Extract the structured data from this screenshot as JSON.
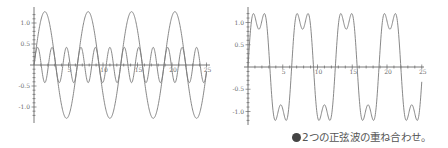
{
  "caption": {
    "text": "2つの正弦波の重ね合わせ。",
    "bullet_icon": "filled-circle"
  },
  "colors": {
    "curve": "#7a7a7a",
    "axis": "#555555",
    "label": "#6a6a6a",
    "caption_bullet": "#444444"
  },
  "chart_data": [
    {
      "type": "line",
      "title": "",
      "xlabel": "",
      "ylabel": "",
      "x_ticks": [
        5,
        10,
        15,
        20,
        25
      ],
      "x_tick_labels": [
        "5",
        "10",
        "15",
        "20",
        "25"
      ],
      "y_ticks": [
        1.0,
        0.5,
        -0.5,
        -1.0
      ],
      "y_tick_labels": [
        "1.0",
        "0.5",
        "-0.5",
        "-1.0"
      ],
      "xlim": [
        0,
        25
      ],
      "ylim": [
        -1.35,
        1.35
      ],
      "grid": false,
      "legend": false,
      "series": [
        {
          "name": "sin(x) component",
          "formula": "(4/pi)*sin(x)",
          "amplitude": 1.27,
          "frequency": 1
        },
        {
          "name": "sin(3x) component",
          "formula": "(4/(3pi))*sin(3x)",
          "amplitude": 0.42,
          "frequency": 3
        }
      ],
      "layout": {
        "origin_px": [
          34,
          65
        ],
        "px_per_x": 6.9,
        "px_per_y": 42,
        "y_axis_top": 7,
        "y_axis_bottom": 123,
        "x_axis_right": 210
      }
    },
    {
      "type": "line",
      "title": "",
      "xlabel": "",
      "ylabel": "",
      "x_ticks": [
        5,
        10,
        15,
        20,
        25
      ],
      "x_tick_labels": [
        "5",
        "10",
        "15",
        "20",
        "25"
      ],
      "y_ticks": [
        1.0,
        0.5,
        -0.5,
        -1.0
      ],
      "y_tick_labels": [
        "1.0",
        "0.5",
        "-0.5",
        "-1.0"
      ],
      "xlim": [
        0,
        25
      ],
      "ylim": [
        -1.3,
        1.3
      ],
      "grid": false,
      "legend": false,
      "series": [
        {
          "name": "sum",
          "formula": "(4/pi)*(sin(x) + sin(3x)/3)",
          "amplitude": 1.2,
          "frequency": 1
        }
      ],
      "layout": {
        "origin_px": [
          24,
          67
        ],
        "px_per_x": 6.95,
        "px_per_y": 44.5,
        "y_axis_top": 7,
        "y_axis_bottom": 125,
        "x_axis_right": 200
      }
    }
  ]
}
